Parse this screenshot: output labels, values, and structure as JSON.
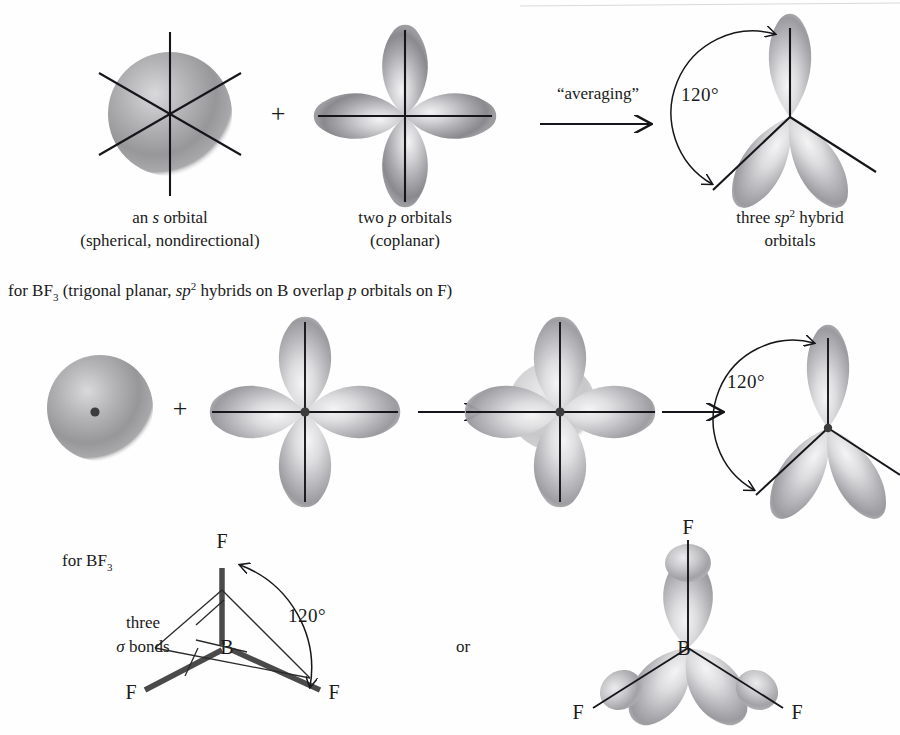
{
  "figure": {
    "title_row1_caption_left_line1": "an s orbital",
    "topology": "sp2 hybridization of boron in BF3"
  },
  "row1": {
    "panel_s": {
      "caption_line1_pre": "an ",
      "caption_line1_italic": "s",
      "caption_line1_post": " orbital",
      "caption_line2": "(spherical, nondirectional)"
    },
    "operator_plus": "+",
    "panel_p": {
      "caption_line1_pre": "two ",
      "caption_line1_italic": "p",
      "caption_line1_post": " orbitals",
      "caption_line2": "(coplanar)"
    },
    "arrow_label": "“averaging”",
    "panel_sp2": {
      "angle_label": "120°",
      "caption_line1_pre": "three ",
      "caption_line1_italic": "sp",
      "caption_line1_sup": "2",
      "caption_line1_post": " hybrid",
      "caption_line2": "orbitals"
    }
  },
  "bf3_note": {
    "pre": "for BF",
    "sub": "3",
    "mid1": " (trigonal planar, ",
    "italic1": "sp",
    "sup1": "2",
    "mid2": " hybrids on B overlap ",
    "italic2": "p",
    "post": " orbitals on F)"
  },
  "row2": {
    "operator_plus": "+",
    "angle_label": "120°"
  },
  "row3": {
    "label_bf3_pre": "for BF",
    "label_bf3_sub": "3",
    "three_sigma_line1": "three",
    "three_sigma_line2_symbol": "σ",
    "three_sigma_line2_text": " bonds",
    "angle_label": "120°",
    "or_label": "or",
    "skeletal": {
      "center_atom": "B",
      "ligand_top": "F",
      "ligand_left": "F",
      "ligand_right": "F"
    },
    "overlap": {
      "center_atom": "B",
      "ligand_top": "F",
      "ligand_left": "F",
      "ligand_right": "F"
    }
  },
  "colors": {
    "ink": "#16161a",
    "orbital_mid": "#8e8e90",
    "orbital_dark": "#6f6f72",
    "orbital_light": "#e6e6e8",
    "bond_gray": "#4a4a4a",
    "background": "#fefefe"
  }
}
